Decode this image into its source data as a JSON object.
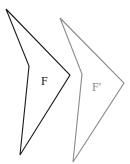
{
  "diagram": {
    "shapes": [
      {
        "label": "F",
        "stroke": "#1a1a1a",
        "points": [
          [
            6,
            9
          ],
          [
            29,
            66
          ],
          [
            20,
            155
          ],
          [
            70,
            75
          ]
        ],
        "label_pos": [
          41,
          85
        ]
      },
      {
        "label": "F′",
        "stroke": "#8a8a8a",
        "points": [
          [
            60,
            18
          ],
          [
            82,
            74
          ],
          [
            73,
            162
          ],
          [
            124,
            83
          ]
        ],
        "label_pos": [
          92,
          91
        ]
      }
    ]
  }
}
